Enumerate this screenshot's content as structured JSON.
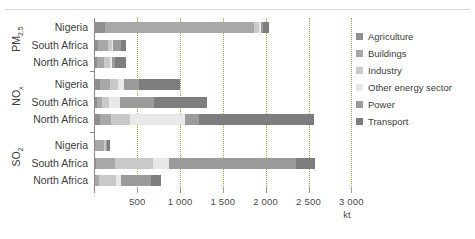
{
  "chart_data": {
    "type": "bar",
    "orientation": "horizontal",
    "stacked": true,
    "title": "",
    "xlabel": "kt",
    "ylabel": "",
    "xlim": [
      0,
      3000
    ],
    "xticks": [
      500,
      1000,
      1500,
      2000,
      2500,
      3000
    ],
    "xtick_labels": [
      "500",
      "1 000",
      "1 500",
      "2 000",
      "2 500",
      "3 000"
    ],
    "grid": "vertical-dotted",
    "legend_position": "right",
    "legend": [
      "Agriculture",
      "Buildings",
      "Industry",
      "Other energy sector",
      "Power",
      "Transport"
    ],
    "series": [
      {
        "name": "Agriculture",
        "color": "#8f8f8f"
      },
      {
        "name": "Buildings",
        "color": "#a8a8a8"
      },
      {
        "name": "Industry",
        "color": "#c9c9c9"
      },
      {
        "name": "Other energy sector",
        "color": "#e8e8e8"
      },
      {
        "name": "Power",
        "color": "#9b9b9b"
      },
      {
        "name": "Transport",
        "color": "#7d7d7d"
      }
    ],
    "groups": [
      {
        "label": "PM2.5",
        "label_base": "PM",
        "label_sub": "2.5",
        "rows": [
          {
            "category": "Nigeria",
            "values": [
              120,
              1740,
              60,
              20,
              30,
              70
            ],
            "total": 2040
          },
          {
            "category": "South Africa",
            "values": [
              40,
              120,
              40,
              15,
              95,
              55
            ],
            "total": 365
          },
          {
            "category": "North Africa",
            "values": [
              35,
              75,
              75,
              15,
              40,
              130
            ],
            "total": 370
          }
        ]
      },
      {
        "label": "NOx",
        "label_base": "NO",
        "label_sub": "x",
        "rows": [
          {
            "category": "Nigeria",
            "values": [
              60,
              120,
              100,
              70,
              170,
              480
            ],
            "total": 1000
          },
          {
            "category": "South Africa",
            "values": [
              30,
              60,
              80,
              130,
              400,
              620
            ],
            "total": 1320
          },
          {
            "category": "North Africa",
            "values": [
              60,
              130,
              230,
              640,
              160,
              1340
            ],
            "total": 2560
          }
        ]
      },
      {
        "label": "SO2",
        "label_base": "SO",
        "label_sub": "2",
        "rows": [
          {
            "category": "Nigeria",
            "values": [
              10,
              100,
              20,
              10,
              10,
              30
            ],
            "total": 180
          },
          {
            "category": "South Africa",
            "values": [
              15,
              220,
              450,
              185,
              1480,
              230
            ],
            "total": 2580
          },
          {
            "category": "North Africa",
            "values": [
              10,
              40,
              200,
              60,
              350,
              120
            ],
            "total": 780
          }
        ]
      }
    ]
  }
}
